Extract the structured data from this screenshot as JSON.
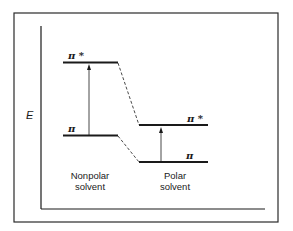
{
  "diagram": {
    "type": "energy-level diagram",
    "axis": {
      "y_label": "E"
    },
    "columns": [
      {
        "caption_line1": "Nonpolar",
        "caption_line2": "solvent",
        "levels": [
          {
            "label": "π *",
            "name": "pi-star"
          },
          {
            "label": "π",
            "name": "pi"
          }
        ]
      },
      {
        "caption_line1": "Polar",
        "caption_line2": "solvent",
        "levels": [
          {
            "label": "π *",
            "name": "pi-star"
          },
          {
            "label": "π",
            "name": "pi"
          }
        ]
      }
    ],
    "colors": {
      "line": "#1a1a1a",
      "background": "#ffffff"
    }
  }
}
